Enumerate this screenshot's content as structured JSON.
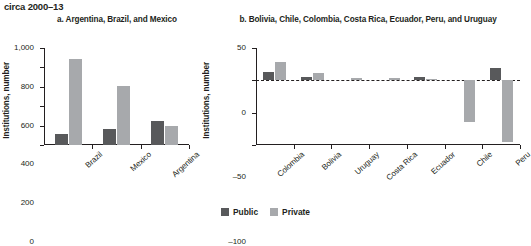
{
  "header": {
    "title": "circa 2000–13"
  },
  "legend": {
    "position": "bottom-center",
    "items": [
      {
        "label": "Public",
        "color": "#58595b"
      },
      {
        "label": "Private",
        "color": "#a7a9ac"
      }
    ]
  },
  "chart_data": [
    {
      "type": "bar",
      "panel": "a",
      "title": "a. Argentina, Brazil, and Mexico",
      "xlabel": "",
      "ylabel": "Institutions, number",
      "ylim": [
        0,
        1000
      ],
      "yticks": [
        0,
        200,
        400,
        600,
        800,
        1000
      ],
      "ytick_labels": [
        "0",
        "200",
        "400",
        "600",
        "800",
        "1,000"
      ],
      "grid": false,
      "categories": [
        "Brazil",
        "Mexico",
        "Argentina"
      ],
      "series": [
        {
          "name": "Public",
          "color": "#58595b",
          "values": [
            110,
            160,
            250
          ]
        },
        {
          "name": "Private",
          "color": "#a7a9ac",
          "values": [
            890,
            605,
            200
          ]
        }
      ]
    },
    {
      "type": "bar",
      "panel": "b",
      "title": "b. Bolivia, Chile, Colombia, Costa Rica, Ecuador, Peru, and Uruguay",
      "xlabel": "",
      "ylabel": "Institutions, number",
      "ylim": [
        -100,
        50
      ],
      "yticks": [
        -100,
        -50,
        0,
        50
      ],
      "ytick_labels": [
        "–100",
        "–50",
        "0",
        "50"
      ],
      "grid": false,
      "zero_line": true,
      "categories": [
        "Colombia",
        "Bolivia",
        "Uruguay",
        "Costa Rica",
        "Ecuador",
        "Chile",
        "Peru"
      ],
      "series": [
        {
          "name": "Public",
          "color": "#58595b",
          "values": [
            13,
            5,
            0,
            0,
            5,
            0,
            19
          ]
        },
        {
          "name": "Private",
          "color": "#a7a9ac",
          "values": [
            28,
            12,
            4,
            3,
            2,
            -65,
            -96
          ]
        }
      ]
    }
  ]
}
